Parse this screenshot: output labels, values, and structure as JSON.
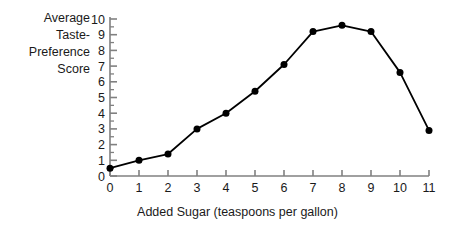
{
  "chart_data": {
    "type": "line",
    "title": "",
    "subtitle": "",
    "xlabel": "Added Sugar (teaspoons per gallon)",
    "ylabel": "Average\nTaste-\nPreference\nScore",
    "ylabel_lines": [
      "Average",
      "Taste-",
      "Preference",
      "Score"
    ],
    "x": [
      0,
      1,
      2,
      3,
      4,
      5,
      6,
      7,
      8,
      9,
      10,
      11
    ],
    "values": [
      0.5,
      1.0,
      1.4,
      3.0,
      4.0,
      5.4,
      7.1,
      9.2,
      9.6,
      9.2,
      6.6,
      2.9
    ],
    "series": [
      {
        "name": "Average Taste-Preference Score",
        "values": [
          0.5,
          1.0,
          1.4,
          3.0,
          4.0,
          5.4,
          7.1,
          9.2,
          9.6,
          9.2,
          6.6,
          2.9
        ]
      }
    ],
    "xlim": [
      0,
      11
    ],
    "ylim": [
      0,
      10
    ],
    "xticks": [
      0,
      1,
      2,
      3,
      4,
      5,
      6,
      7,
      8,
      9,
      10,
      11
    ],
    "xtick_labels": [
      "0",
      "1",
      "2",
      "3",
      "4",
      "5",
      "6",
      "7",
      "8",
      "9",
      "10",
      "11"
    ],
    "yticks": [
      0,
      1,
      2,
      3,
      4,
      5,
      6,
      7,
      8,
      9,
      10
    ],
    "ytick_labels": [
      "0",
      "1",
      "2",
      "3",
      "4",
      "5",
      "6",
      "7",
      "8",
      "9",
      "10"
    ],
    "y_minor_tick_step": 0.5,
    "grid": false,
    "legend": false,
    "legend_position": "none",
    "annotations": [],
    "colors": {
      "line": "#000000",
      "marker": "#000000",
      "axis": "#808080",
      "text": "#1a1a1a",
      "background": "#ffffff"
    },
    "marker": "circle",
    "marker_size": 7,
    "line_width": 1.8
  }
}
